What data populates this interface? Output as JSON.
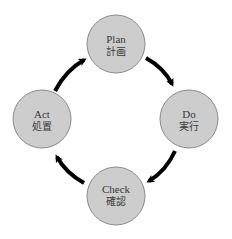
{
  "diagram": {
    "colors": {
      "node_fill": "#cdcdcd",
      "node_stroke": "#8a8a8a",
      "arrow": "#000000",
      "text": "#3a3a3a",
      "background": "#ffffff"
    },
    "nodes": [
      {
        "id": "plan",
        "label_en": "Plan",
        "label_ja": "計画",
        "cx": 116,
        "cy": 44,
        "r": 29
      },
      {
        "id": "do",
        "label_en": "Do",
        "label_ja": "実行",
        "cx": 189,
        "cy": 119,
        "r": 29
      },
      {
        "id": "check",
        "label_en": "Check",
        "label_ja": "確認",
        "cx": 116,
        "cy": 196,
        "r": 29
      },
      {
        "id": "act",
        "label_en": "Act",
        "label_ja": "処置",
        "cx": 42,
        "cy": 119,
        "r": 29
      }
    ],
    "edges": [
      {
        "from": "plan",
        "to": "do"
      },
      {
        "from": "do",
        "to": "check"
      },
      {
        "from": "check",
        "to": "act"
      },
      {
        "from": "act",
        "to": "plan"
      }
    ]
  }
}
